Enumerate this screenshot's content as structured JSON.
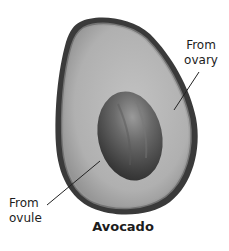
{
  "figure": {
    "caption": "Avocado",
    "labels": [
      {
        "id": "ovary",
        "lines": [
          "From",
          "ovary"
        ],
        "points_to": "fleshy fruit wall"
      },
      {
        "id": "ovule",
        "lines": [
          "From",
          "ovule"
        ],
        "points_to": "seed (pit)"
      }
    ],
    "colors": {
      "background": "#ffffff",
      "skin": "#3a3a3a",
      "flesh": "#b4b4b4",
      "flesh_rim": "#8e8e8e",
      "pit": "#4a4a4a",
      "pit_highlight": "#8a8a8a",
      "text": "#1c1c1c",
      "leader_line": "#222222"
    }
  }
}
